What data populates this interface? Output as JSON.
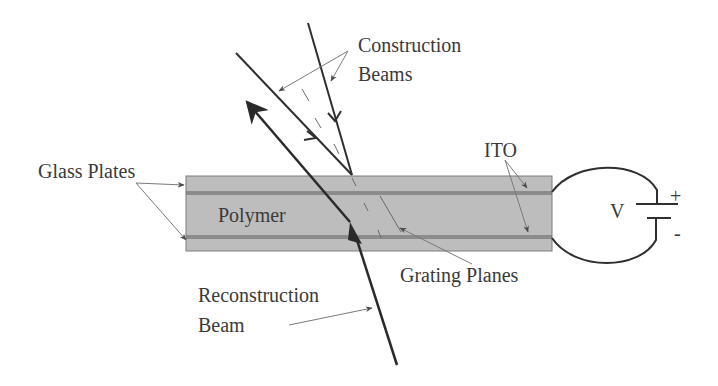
{
  "diagram": {
    "labels": {
      "construction_beams_line1": "Construction",
      "construction_beams_line2": "Beams",
      "glass_plates": "Glass Plates",
      "polymer": "Polymer",
      "ito": "ITO",
      "voltage": "V",
      "plus": "+",
      "minus": "-",
      "grating_planes": "Grating Planes",
      "reconstruction_beam_line1": "Reconstruction",
      "reconstruction_beam_line2": "Beam"
    },
    "colors": {
      "cell_fill": "#bdbdbd",
      "line": "#3a3a3a",
      "pointer": "#7a7a7a",
      "text": "#3a3a3a"
    }
  }
}
